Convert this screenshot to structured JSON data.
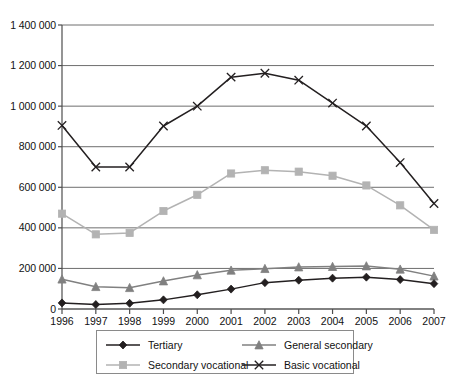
{
  "chart_data": {
    "type": "line",
    "title": "",
    "subtitle": "",
    "xlabel": "",
    "ylabel": "",
    "x": [
      1996,
      1997,
      1998,
      1999,
      2000,
      2001,
      2002,
      2003,
      2004,
      2005,
      2006,
      2007
    ],
    "categories": [
      "1996",
      "1997",
      "1998",
      "1999",
      "2000",
      "2001",
      "2002",
      "2003",
      "2004",
      "2005",
      "2006",
      "2007"
    ],
    "ylim": [
      0,
      1400000
    ],
    "ytick_values": [
      0,
      200000,
      400000,
      600000,
      800000,
      1000000,
      1200000,
      1400000
    ],
    "ytick_labels": [
      "0",
      "200 000",
      "400 000",
      "600 000",
      "800 000",
      "1 000 000",
      "1 200 000",
      "1 400 000"
    ],
    "grid": "horizontal",
    "legend_position": "bottom",
    "series": [
      {
        "name": "Tertiary",
        "marker": "diamond",
        "color": "#231f20",
        "values": [
          30000,
          22000,
          28000,
          45000,
          70000,
          98000,
          130000,
          142000,
          152000,
          157000,
          145000,
          125000
        ]
      },
      {
        "name": "General secondary",
        "marker": "triangle",
        "color": "#808080",
        "values": [
          147000,
          110000,
          105000,
          138000,
          168000,
          191000,
          199000,
          207000,
          209000,
          212000,
          196000,
          162000
        ]
      },
      {
        "name": "Secondary vocational",
        "marker": "square",
        "color": "#b3b3b3",
        "values": [
          470000,
          368000,
          375000,
          483000,
          563000,
          668000,
          684000,
          677000,
          657000,
          609000,
          511000,
          390000
        ]
      },
      {
        "name": "Basic vocational",
        "marker": "cross",
        "color": "#231f20",
        "values": [
          905000,
          700000,
          700000,
          902000,
          1000000,
          1143000,
          1162000,
          1128000,
          1015000,
          902000,
          722000,
          520000
        ]
      }
    ]
  },
  "legend": {
    "entries": [
      {
        "label": "Tertiary"
      },
      {
        "label": "General secondary"
      },
      {
        "label": "Secondary vocational"
      },
      {
        "label": "Basic vocational"
      }
    ]
  },
  "colors": {
    "axis": "#4d4d4d",
    "grid": "#6e6e6e",
    "text": "#111111",
    "legend_border": "#8a8a8a",
    "background": "#ffffff"
  }
}
